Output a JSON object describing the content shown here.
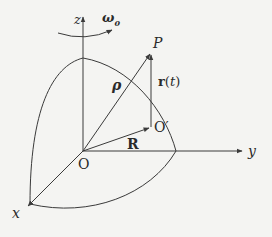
{
  "diagram": {
    "type": "rotating-frame-coordinate-diagram",
    "axes": {
      "z": "z",
      "y": "y",
      "x": "x"
    },
    "angular_velocity": {
      "symbol": "ω",
      "subscript": "0"
    },
    "origin": "O",
    "moving_origin": "O′",
    "point": "P",
    "vectors": {
      "rho": "ρ",
      "r": "r(t)",
      "R": "R"
    },
    "colors": {
      "line": "#3a3a3a",
      "text": "#2a2a2a",
      "background": "#f4f4f2"
    }
  }
}
